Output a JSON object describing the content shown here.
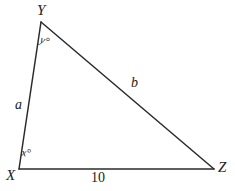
{
  "figure": {
    "kind": "triangle-diagram",
    "background_color": "#ffffff",
    "stroke_color": "#2b2b2b",
    "stroke_width": 1.5,
    "canvas": {
      "width": 235,
      "height": 191
    },
    "vertices": {
      "X": {
        "label": "X",
        "x": 19,
        "y": 169
      },
      "Y": {
        "label": "Y",
        "x": 41,
        "y": 22
      },
      "Z": {
        "label": "Z",
        "x": 214,
        "y": 169
      }
    },
    "sides": {
      "XY": {
        "label": "a",
        "from": "X",
        "to": "Y"
      },
      "YZ": {
        "label": "b",
        "from": "Y",
        "to": "Z"
      },
      "XZ": {
        "label": "10",
        "from": "X",
        "to": "Z"
      }
    },
    "angles": {
      "at_X": {
        "label": "x°"
      },
      "at_Y": {
        "label": "y°"
      }
    }
  }
}
